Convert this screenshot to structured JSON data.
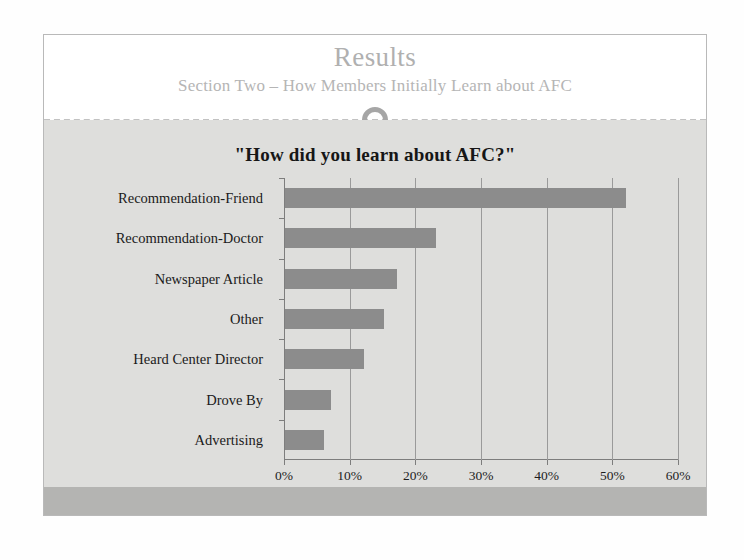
{
  "slide": {
    "title": "Results",
    "subtitle": "Section Two – How Members Initially Learn about AFC",
    "divider_icon": "circle-ornament",
    "theme": {
      "header_background": "#ffffff",
      "body_background": "#dededc",
      "footer_background": "#b4b4b2",
      "title_color": "#b0b0b0",
      "bar_color": "#8c8c8c",
      "gridline_color": "#9a9a9a",
      "axis_color": "#7d7d7d"
    }
  },
  "chart_data": {
    "type": "bar",
    "orientation": "horizontal",
    "title": "\"How did you learn about AFC?\"",
    "xlabel": "",
    "ylabel": "",
    "categories": [
      "Recommendation-Friend",
      "Recommendation-Doctor",
      "Newspaper Article",
      "Other",
      "Heard Center Director",
      "Drove By",
      "Advertising"
    ],
    "values": [
      52,
      23,
      17,
      15,
      12,
      7,
      6
    ],
    "value_unit": "%",
    "xlim": [
      0,
      60
    ],
    "xticks": [
      0,
      10,
      20,
      30,
      40,
      50,
      60
    ],
    "xtick_labels": [
      "0%",
      "10%",
      "20%",
      "30%",
      "40%",
      "50%",
      "60%"
    ],
    "grid": true,
    "grid_axis": "x",
    "legend": false,
    "series": [
      {
        "name": "How did you learn about AFC?",
        "color": "#8c8c8c",
        "values": [
          52,
          23,
          17,
          15,
          12,
          7,
          6
        ]
      }
    ]
  }
}
